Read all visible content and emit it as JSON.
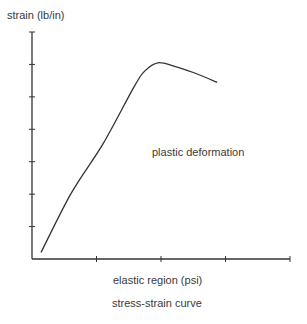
{
  "chart_data": {
    "type": "line",
    "title": "stress-strain curve",
    "xlabel": "elastic region (psi)",
    "ylabel": "strain (lb/in)",
    "annotations": [
      {
        "text": "plastic deformation",
        "x": 2.0,
        "y": 3.1
      }
    ],
    "xlim": [
      0,
      4
    ],
    "ylim": [
      0,
      7
    ],
    "x_ticks": [
      1,
      2,
      3,
      4
    ],
    "y_ticks": [
      1,
      2,
      3,
      4,
      5,
      6,
      7
    ],
    "x_tick_labels": [],
    "y_tick_labels": [],
    "grid": false,
    "legend": null,
    "series": [
      {
        "name": "stress-strain",
        "color": "#333333",
        "x": [
          0.14,
          0.6,
          1.1,
          1.58,
          1.75,
          1.95,
          2.2,
          2.5,
          2.87
        ],
        "y": [
          0.2,
          2.0,
          3.55,
          5.3,
          5.8,
          6.05,
          5.95,
          5.75,
          5.45
        ]
      }
    ]
  },
  "labels": {
    "ylabel": "strain (lb/in)",
    "xlabel": "elastic region (psi)",
    "annotation": "plastic deformation",
    "title": "stress-strain curve"
  },
  "colors": {
    "axis": "#333333",
    "line": "#333333",
    "text": "#3a3a3a",
    "background": "#ffffff"
  }
}
